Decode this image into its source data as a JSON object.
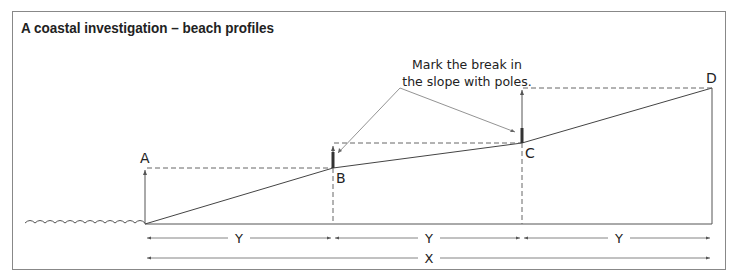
{
  "title": "A  coastal investigation – beach profiles",
  "annotation": {
    "line1": "Mark the break in",
    "line2": "the slope with poles."
  },
  "points": [
    {
      "label": "A",
      "x": 145,
      "y": 168
    },
    {
      "label": "B",
      "x": 333,
      "y": 168
    },
    {
      "label": "C",
      "x": 522,
      "y": 143
    },
    {
      "label": "D",
      "x": 712,
      "y": 88
    }
  ],
  "dimensions": {
    "segment_label": "Y",
    "total_label": "X"
  },
  "colors": {
    "line": "#444444",
    "dash": "#666666",
    "frame": "#888888"
  }
}
